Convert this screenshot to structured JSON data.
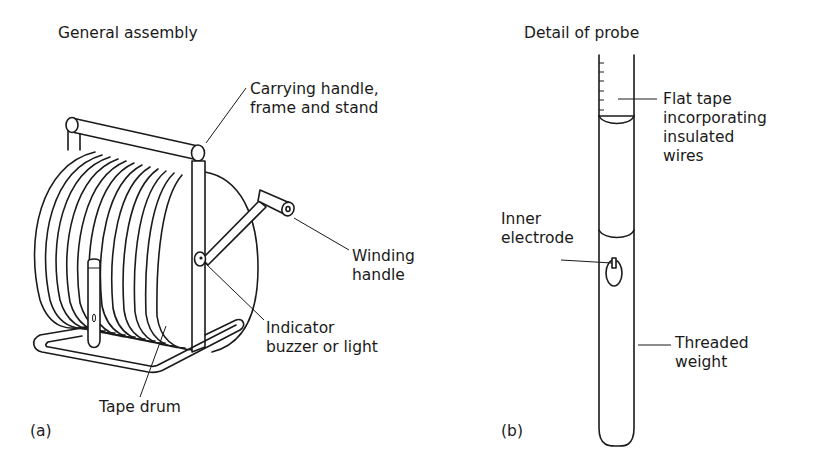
{
  "panel_a": {
    "title": "General assembly",
    "panel_label": "(a)",
    "callouts": {
      "frame": "Carrying handle,\nframe and stand",
      "winding_handle": "Winding\nhandle",
      "indicator": "Indicator\nbuzzer or light",
      "tape_drum": "Tape drum"
    }
  },
  "panel_b": {
    "title": "Detail of probe",
    "panel_label": "(b)",
    "callouts": {
      "flat_tape": "Flat tape\nincorporating\ninsulated\nwires",
      "inner_electrode": "Inner\nelectrode",
      "threaded_weight": "Threaded\nweight"
    }
  },
  "colors": {
    "ink": "#1a1a1a",
    "background": "#ffffff"
  }
}
